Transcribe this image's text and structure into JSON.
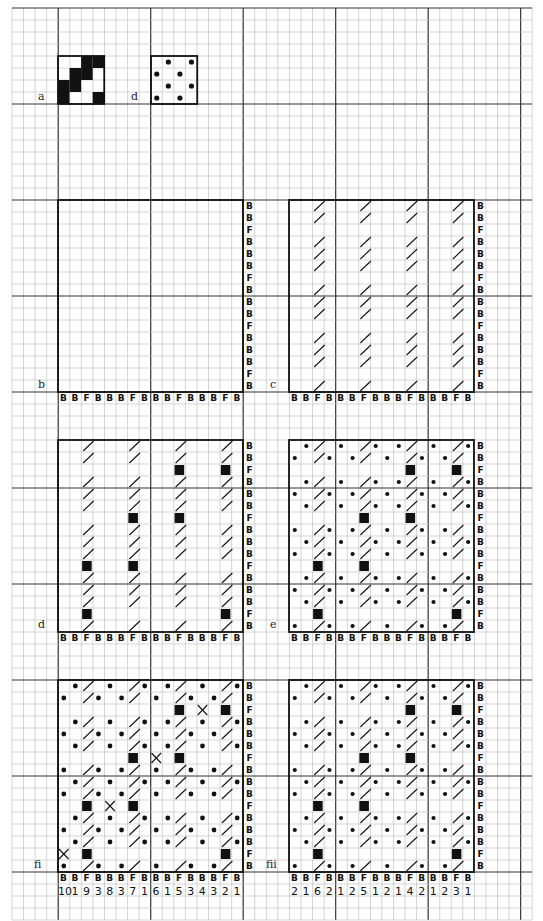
{
  "grid": {
    "origin_x": 12,
    "origin_y": 8,
    "cell_w": 11.56,
    "cell_h": 12,
    "cols": 45,
    "rows": 76,
    "major_every": 8,
    "minor_color": "#b8b8b8",
    "major_color": "#333333"
  },
  "panels": [
    {
      "id": "a",
      "label": "a",
      "x": 58,
      "y": 56,
      "cols": 4,
      "rows": 4,
      "label_x": 38,
      "label_y": 90,
      "squares": [
        [
          0,
          2
        ],
        [
          0,
          3
        ],
        [
          1,
          1
        ],
        [
          1,
          2
        ],
        [
          2,
          0
        ],
        [
          2,
          1
        ],
        [
          3,
          0
        ],
        [
          3,
          3
        ]
      ]
    },
    {
      "id": "d-top",
      "label": "d",
      "x": 151,
      "y": 56,
      "cols": 4,
      "rows": 4,
      "label_x": 131,
      "label_y": 90,
      "dots": [
        [
          0,
          1
        ],
        [
          0,
          3
        ],
        [
          1,
          0
        ],
        [
          1,
          2
        ],
        [
          2,
          1
        ],
        [
          2,
          3
        ],
        [
          3,
          0
        ],
        [
          3,
          2
        ]
      ]
    },
    {
      "id": "b",
      "label": "b",
      "x": 58,
      "y": 200,
      "cols": 16,
      "rows": 16,
      "label_x": 38,
      "label_y": 378,
      "right_labels": [
        "B",
        "B",
        "F",
        "B",
        "B",
        "B",
        "F",
        "B",
        "B",
        "B",
        "F",
        "B",
        "B",
        "B",
        "F",
        "B"
      ],
      "bottom_labels": [
        "B",
        "B",
        "F",
        "B",
        "B",
        "B",
        "F",
        "B",
        "B",
        "B",
        "F",
        "B",
        "B",
        "B",
        "F",
        "B"
      ],
      "pattern": "empty"
    },
    {
      "id": "c",
      "label": "c",
      "x": 289,
      "y": 200,
      "cols": 16,
      "rows": 16,
      "label_x": 270,
      "label_y": 378,
      "right_labels": [
        "B",
        "B",
        "F",
        "B",
        "B",
        "B",
        "F",
        "B",
        "B",
        "B",
        "F",
        "B",
        "B",
        "B",
        "F",
        "B"
      ],
      "bottom_labels": [
        "B",
        "B",
        "F",
        "B",
        "B",
        "B",
        "F",
        "B",
        "B",
        "B",
        "F",
        "B",
        "B",
        "B",
        "F",
        "B"
      ],
      "pattern": "slashes"
    },
    {
      "id": "d",
      "label": "d",
      "x": 58,
      "y": 440,
      "cols": 16,
      "rows": 16,
      "label_x": 38,
      "label_y": 618,
      "right_labels": [
        "B",
        "B",
        "F",
        "B",
        "B",
        "B",
        "F",
        "B",
        "B",
        "B",
        "F",
        "B",
        "B",
        "B",
        "F",
        "B"
      ],
      "bottom_labels": [
        "B",
        "B",
        "F",
        "B",
        "B",
        "B",
        "F",
        "B",
        "B",
        "B",
        "F",
        "B",
        "B",
        "B",
        "F",
        "B"
      ],
      "pattern": "slashes+squares"
    },
    {
      "id": "e",
      "label": "e",
      "x": 289,
      "y": 440,
      "cols": 16,
      "rows": 16,
      "label_x": 270,
      "label_y": 618,
      "right_labels": [
        "B",
        "B",
        "F",
        "B",
        "B",
        "B",
        "F",
        "B",
        "B",
        "B",
        "F",
        "B",
        "B",
        "B",
        "F",
        "B"
      ],
      "bottom_labels": [
        "B",
        "B",
        "F",
        "B",
        "B",
        "B",
        "F",
        "B",
        "B",
        "B",
        "F",
        "B",
        "B",
        "B",
        "F",
        "B"
      ],
      "pattern": "slashes+squares+dots"
    },
    {
      "id": "fi",
      "label": "fi",
      "x": 58,
      "y": 680,
      "cols": 16,
      "rows": 16,
      "label_x": 34,
      "label_y": 858,
      "right_labels": [
        "B",
        "B",
        "F",
        "B",
        "B",
        "B",
        "F",
        "B",
        "B",
        "B",
        "F",
        "B",
        "B",
        "B",
        "F",
        "B"
      ],
      "bottom_labels": [
        "B",
        "B",
        "F",
        "B",
        "B",
        "B",
        "F",
        "B",
        "B",
        "B",
        "F",
        "B",
        "B",
        "B",
        "F",
        "B"
      ],
      "numbers": [
        "10",
        "1",
        "9",
        "3",
        "8",
        "3",
        "7",
        "1",
        "6",
        "1",
        "5",
        "3",
        "4",
        "3",
        "2",
        "1"
      ],
      "pattern": "slashes+squares+dots+crosses",
      "crosses": [
        [
          2,
          12
        ],
        [
          6,
          8
        ],
        [
          10,
          4
        ],
        [
          14,
          0
        ]
      ]
    },
    {
      "id": "fii",
      "label": "fii",
      "x": 289,
      "y": 680,
      "cols": 16,
      "rows": 16,
      "label_x": 266,
      "label_y": 858,
      "right_labels": [
        "B",
        "B",
        "F",
        "B",
        "B",
        "B",
        "F",
        "B",
        "B",
        "B",
        "F",
        "B",
        "B",
        "B",
        "F",
        "B"
      ],
      "bottom_labels": [
        "B",
        "B",
        "F",
        "B",
        "B",
        "B",
        "F",
        "B",
        "B",
        "B",
        "F",
        "B",
        "B",
        "B",
        "F",
        "B"
      ],
      "numbers": [
        "2",
        "1",
        "6",
        "2",
        "1",
        "2",
        "5",
        "1",
        "2",
        "1",
        "4",
        "2",
        "1",
        "2",
        "3",
        "1"
      ],
      "pattern": "slashes+squares+dots"
    }
  ],
  "motifs": {
    "slash_cols": [
      2,
      6,
      10,
      14
    ],
    "f_rows": [
      2,
      6,
      10,
      14
    ],
    "squares_by_f_row": {
      "2": [
        10,
        14
      ],
      "6": [
        6,
        10
      ],
      "10": [
        2,
        6
      ],
      "14": [
        2,
        14
      ]
    },
    "dots_a": [
      1,
      4,
      7,
      9,
      12,
      15
    ],
    "dots_b": [
      0,
      3,
      5,
      8,
      11,
      13
    ]
  }
}
